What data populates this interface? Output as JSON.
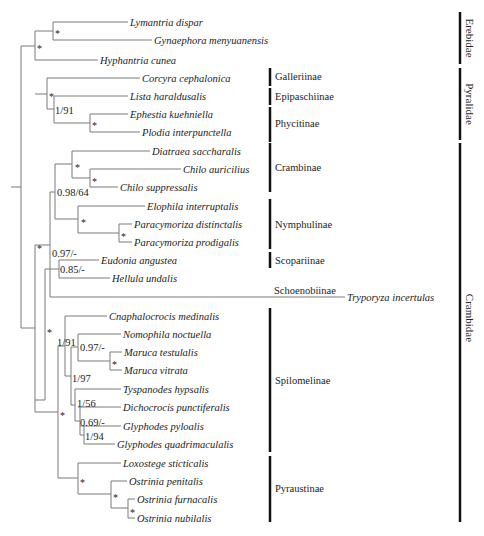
{
  "diagram": {
    "type": "phylogenetic-tree",
    "taxa": [
      {
        "name": "Lymantria dispar",
        "y": 22,
        "x1": 53,
        "x2": 128
      },
      {
        "name": "Gynaephora menyuanensis",
        "y": 40,
        "x1": 53,
        "x2": 152
      },
      {
        "name": "Hyphantria cunea",
        "y": 60,
        "x1": 35,
        "x2": 98
      },
      {
        "name": "Corcyra cephalonica",
        "y": 78,
        "x1": 47,
        "x2": 140
      },
      {
        "name": "Lista haraldusalis",
        "y": 96,
        "x1": 54,
        "x2": 128
      },
      {
        "name": "Ephestia kuehniella",
        "y": 114,
        "x1": 90,
        "x2": 128
      },
      {
        "name": "Plodia interpunctella",
        "y": 132,
        "x1": 90,
        "x2": 140
      },
      {
        "name": "Diatraea saccharalis",
        "y": 151,
        "x1": 72,
        "x2": 150
      },
      {
        "name": "Chilo auricilius",
        "y": 169,
        "x1": 90,
        "x2": 181
      },
      {
        "name": "Chilo suppressalis",
        "y": 187,
        "x1": 90,
        "x2": 118
      },
      {
        "name": "Elophila interruptalis",
        "y": 206,
        "x1": 78,
        "x2": 145
      },
      {
        "name": "Paracymoriza distinctalis",
        "y": 224,
        "x1": 119,
        "x2": 132
      },
      {
        "name": "Paracymoriza prodigalis",
        "y": 242,
        "x1": 119,
        "x2": 132
      },
      {
        "name": "Eudonia angustea",
        "y": 260,
        "x1": 59,
        "x2": 99
      },
      {
        "name": "Hellula undalis",
        "y": 278,
        "x1": 59,
        "x2": 110
      },
      {
        "name": "Tryporyza incertulas",
        "y": 297,
        "x1": 50,
        "x2": 345
      },
      {
        "name": "Cnaphalocrocis medinalis",
        "y": 316,
        "x1": 65,
        "x2": 107
      },
      {
        "name": "Nomophila noctuella",
        "y": 334,
        "x1": 78,
        "x2": 121
      },
      {
        "name": "Maruca testulalis",
        "y": 352,
        "x1": 110,
        "x2": 122
      },
      {
        "name": "Maruca vitrata",
        "y": 370,
        "x1": 110,
        "x2": 122
      },
      {
        "name": "Tyspanodes hypsalis",
        "y": 389,
        "x1": 75,
        "x2": 121
      },
      {
        "name": "Dichocrocis punctiferalis",
        "y": 407,
        "x1": 78,
        "x2": 121
      },
      {
        "name": "Glyphodes pyloalis",
        "y": 426,
        "x1": 80,
        "x2": 121
      },
      {
        "name": "Glyphodes quadrimaculalis",
        "y": 444,
        "x1": 84,
        "x2": 115
      },
      {
        "name": "Loxostege sticticalis",
        "y": 463,
        "x1": 78,
        "x2": 121
      },
      {
        "name": "Ostrinia penitalis",
        "y": 481,
        "x1": 111,
        "x2": 127
      },
      {
        "name": "Ostrinia furnacalis",
        "y": 499,
        "x1": 128,
        "x2": 135
      },
      {
        "name": "Ostrinia nubilalis",
        "y": 518,
        "x1": 128,
        "x2": 135
      }
    ],
    "verticals": [
      {
        "x": 53,
        "y1": 22,
        "y2": 40
      },
      {
        "x": 35,
        "y1": 31,
        "y2": 60
      },
      {
        "x": 90,
        "y1": 114,
        "y2": 132
      },
      {
        "x": 54,
        "y1": 96,
        "y2": 123
      },
      {
        "x": 47,
        "y1": 78,
        "y2": 109
      },
      {
        "x": 90,
        "y1": 169,
        "y2": 187
      },
      {
        "x": 72,
        "y1": 151,
        "y2": 178
      },
      {
        "x": 119,
        "y1": 224,
        "y2": 242
      },
      {
        "x": 78,
        "y1": 206,
        "y2": 233
      },
      {
        "x": 55,
        "y1": 164,
        "y2": 219
      },
      {
        "x": 59,
        "y1": 260,
        "y2": 278
      },
      {
        "x": 50,
        "y1": 192,
        "y2": 297
      },
      {
        "x": 45,
        "y1": 269,
        "y2": 400
      },
      {
        "x": 110,
        "y1": 352,
        "y2": 370
      },
      {
        "x": 78,
        "y1": 334,
        "y2": 361
      },
      {
        "x": 84,
        "y1": 426,
        "y2": 444
      },
      {
        "x": 80,
        "y1": 407,
        "y2": 435
      },
      {
        "x": 75,
        "y1": 389,
        "y2": 421
      },
      {
        "x": 71,
        "y1": 347,
        "y2": 405
      },
      {
        "x": 65,
        "y1": 316,
        "y2": 376
      },
      {
        "x": 128,
        "y1": 499,
        "y2": 518
      },
      {
        "x": 111,
        "y1": 481,
        "y2": 508
      },
      {
        "x": 78,
        "y1": 463,
        "y2": 494
      },
      {
        "x": 58,
        "y1": 346,
        "y2": 478
      },
      {
        "x": 35,
        "y1": 245,
        "y2": 412
      },
      {
        "x": 21,
        "y1": 46,
        "y2": 328
      },
      {
        "x": 11,
        "y1": 187,
        "y2": 187
      }
    ],
    "connectors": [
      {
        "y": 31,
        "x1": 35,
        "x2": 53
      },
      {
        "y": 123,
        "x1": 54,
        "x2": 90
      },
      {
        "y": 109,
        "x1": 47,
        "x2": 54
      },
      {
        "y": 94,
        "x1": 35,
        "x2": 47
      },
      {
        "y": 178,
        "x1": 72,
        "x2": 90
      },
      {
        "y": 164,
        "x1": 55,
        "x2": 72
      },
      {
        "y": 233,
        "x1": 78,
        "x2": 119
      },
      {
        "y": 219,
        "x1": 55,
        "x2": 78
      },
      {
        "y": 269,
        "x1": 45,
        "x2": 59
      },
      {
        "y": 192,
        "x1": 50,
        "x2": 55
      },
      {
        "y": 245,
        "x1": 35,
        "x2": 50
      },
      {
        "y": 361,
        "x1": 78,
        "x2": 110
      },
      {
        "y": 347,
        "x1": 71,
        "x2": 78
      },
      {
        "y": 435,
        "x1": 80,
        "x2": 84
      },
      {
        "y": 421,
        "x1": 75,
        "x2": 80
      },
      {
        "y": 405,
        "x1": 71,
        "x2": 75
      },
      {
        "y": 376,
        "x1": 65,
        "x2": 71
      },
      {
        "y": 346,
        "x1": 58,
        "x2": 65
      },
      {
        "y": 508,
        "x1": 111,
        "x2": 128
      },
      {
        "y": 494,
        "x1": 78,
        "x2": 111
      },
      {
        "y": 478,
        "x1": 58,
        "x2": 78
      },
      {
        "y": 412,
        "x1": 35,
        "x2": 58
      },
      {
        "y": 400,
        "x1": 35,
        "x2": 45
      },
      {
        "y": 46,
        "x1": 21,
        "x2": 35
      },
      {
        "y": 328,
        "x1": 21,
        "x2": 35
      },
      {
        "y": 187,
        "x1": 11,
        "x2": 21
      }
    ],
    "supports": [
      {
        "label": "*",
        "x": 55,
        "y": 33,
        "kind": "star"
      },
      {
        "label": "*",
        "x": 37,
        "y": 48,
        "kind": "star"
      },
      {
        "label": "*",
        "x": 49,
        "y": 96,
        "kind": "star"
      },
      {
        "label": "1/91",
        "x": 55,
        "y": 114,
        "kind": "value"
      },
      {
        "label": "*",
        "x": 92,
        "y": 125,
        "kind": "star"
      },
      {
        "label": "*",
        "x": 75,
        "y": 167,
        "kind": "star"
      },
      {
        "label": "*",
        "x": 92,
        "y": 181,
        "kind": "star"
      },
      {
        "label": "0.98/64",
        "x": 57,
        "y": 196,
        "kind": "value"
      },
      {
        "label": "*",
        "x": 81,
        "y": 222,
        "kind": "star"
      },
      {
        "label": "*",
        "x": 121,
        "y": 236,
        "kind": "star"
      },
      {
        "label": "0.97/-",
        "x": 52,
        "y": 257,
        "kind": "value"
      },
      {
        "label": "0.85/-",
        "x": 60,
        "y": 273,
        "kind": "value"
      },
      {
        "label": "*",
        "x": 37,
        "y": 248,
        "kind": "star"
      },
      {
        "label": "*",
        "x": 47,
        "y": 332,
        "kind": "star"
      },
      {
        "label": "1/91",
        "x": 57,
        "y": 346,
        "kind": "value"
      },
      {
        "label": "0.97/-",
        "x": 80,
        "y": 351,
        "kind": "value"
      },
      {
        "label": "*",
        "x": 112,
        "y": 364,
        "kind": "star"
      },
      {
        "label": "1/97",
        "x": 72,
        "y": 382,
        "kind": "value"
      },
      {
        "label": "1/56",
        "x": 77,
        "y": 407,
        "kind": "value"
      },
      {
        "label": "0.69/-",
        "x": 80,
        "y": 426,
        "kind": "value"
      },
      {
        "label": "1/94",
        "x": 85,
        "y": 440,
        "kind": "value"
      },
      {
        "label": "*",
        "x": 60,
        "y": 415,
        "kind": "star"
      },
      {
        "label": "*",
        "x": 80,
        "y": 482,
        "kind": "star"
      },
      {
        "label": "*",
        "x": 113,
        "y": 497,
        "kind": "star"
      },
      {
        "label": "*",
        "x": 130,
        "y": 512,
        "kind": "star"
      }
    ],
    "subfamilies": [
      {
        "name": "Galleriinae",
        "y1": 68,
        "y2": 86,
        "label_y": 80
      },
      {
        "name": "Epipaschiinae",
        "y1": 88,
        "y2": 105,
        "label_y": 100
      },
      {
        "name": "Phycitinae",
        "y1": 107,
        "y2": 142,
        "label_y": 127
      },
      {
        "name": "Crambinae",
        "y1": 143,
        "y2": 192,
        "label_y": 171
      },
      {
        "name": "Nymphulinae",
        "y1": 199,
        "y2": 249,
        "label_y": 228
      },
      {
        "name": "Scopariinae",
        "y1": 252,
        "y2": 268,
        "label_y": 264
      },
      {
        "name": "Spilomelinae",
        "y1": 308,
        "y2": 452,
        "label_y": 384
      },
      {
        "name": "Pyraustinae",
        "y1": 456,
        "y2": 522,
        "label_y": 492
      }
    ],
    "schoenobiinae": {
      "name": "Schoenobiinae",
      "x": 274,
      "y": 294
    },
    "families": [
      {
        "name": "Erebidae",
        "y1": 12,
        "y2": 64,
        "label_y": 38
      },
      {
        "name": "Pyralidae",
        "y1": 68,
        "y2": 140,
        "label_y": 104
      },
      {
        "name": "Crambidae",
        "y1": 143,
        "y2": 522,
        "label_y": 318
      }
    ],
    "subfam_bar_x": 270,
    "fam_bar_x": 460
  }
}
